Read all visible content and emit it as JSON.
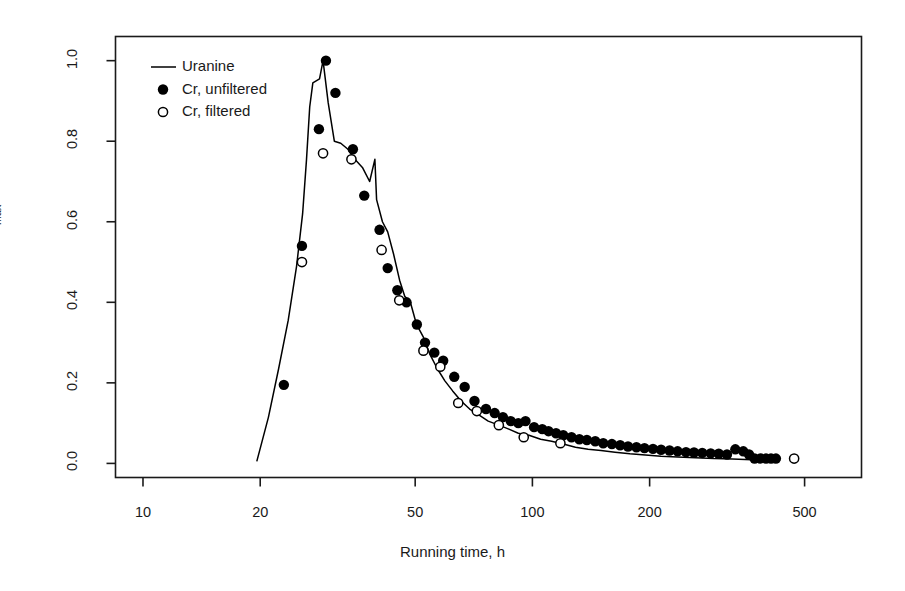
{
  "chart_data": {
    "type": "scatter",
    "title": "",
    "xlabel": "Running time, h",
    "ylabel": "C/Cmax",
    "ylabel_base": "C/C",
    "ylabel_sub": "max",
    "xscale": "log",
    "yscale": "linear",
    "xlim": [
      8.5,
      700
    ],
    "ylim": [
      -0.035,
      1.06
    ],
    "grid": false,
    "xticks": [
      10,
      20,
      50,
      100,
      200,
      500
    ],
    "xtick_labels": [
      "10",
      "20",
      "50",
      "100",
      "200",
      "500"
    ],
    "yticks": [
      0.0,
      0.2,
      0.4,
      0.6,
      0.8,
      1.0
    ],
    "ytick_labels": [
      "0.0",
      "0.2",
      "0.4",
      "0.6",
      "0.8",
      "1.0"
    ],
    "legend_position": "top-left",
    "series": [
      {
        "name": "Uranine",
        "marker": "line",
        "color": "#000000",
        "points": [
          [
            19.6,
            0.005
          ],
          [
            21.0,
            0.115
          ],
          [
            22.3,
            0.235
          ],
          [
            23.6,
            0.355
          ],
          [
            24.8,
            0.49
          ],
          [
            25.7,
            0.62
          ],
          [
            26.3,
            0.755
          ],
          [
            26.8,
            0.885
          ],
          [
            27.3,
            0.945
          ],
          [
            28.4,
            0.955
          ],
          [
            29.0,
            1.0
          ],
          [
            29.9,
            0.895
          ],
          [
            31.0,
            0.8
          ],
          [
            32.2,
            0.795
          ],
          [
            33.6,
            0.78
          ],
          [
            35.0,
            0.755
          ],
          [
            36.6,
            0.735
          ],
          [
            38.2,
            0.7
          ],
          [
            39.4,
            0.755
          ],
          [
            39.8,
            0.655
          ],
          [
            41.2,
            0.6
          ],
          [
            42.5,
            0.575
          ],
          [
            44.0,
            0.52
          ],
          [
            45.6,
            0.455
          ],
          [
            47.0,
            0.415
          ],
          [
            48.6,
            0.4
          ],
          [
            50.4,
            0.345
          ],
          [
            52.4,
            0.315
          ],
          [
            54.6,
            0.27
          ],
          [
            57.0,
            0.235
          ],
          [
            59.6,
            0.205
          ],
          [
            62.4,
            0.18
          ],
          [
            65.6,
            0.155
          ],
          [
            69.0,
            0.135
          ],
          [
            73.0,
            0.12
          ],
          [
            77.0,
            0.105
          ],
          [
            82.0,
            0.095
          ],
          [
            87.0,
            0.085
          ],
          [
            92.0,
            0.075
          ],
          [
            98.0,
            0.07
          ],
          [
            105.0,
            0.06
          ],
          [
            112.0,
            0.055
          ],
          [
            120.0,
            0.048
          ],
          [
            129.0,
            0.04
          ],
          [
            139.0,
            0.035
          ],
          [
            150.0,
            0.032
          ],
          [
            163.0,
            0.028
          ],
          [
            178.0,
            0.024
          ],
          [
            195.0,
            0.021
          ],
          [
            214.0,
            0.018
          ],
          [
            236.0,
            0.016
          ],
          [
            262.0,
            0.014
          ],
          [
            292.0,
            0.012
          ],
          [
            326.0,
            0.011
          ],
          [
            366.0,
            0.009
          ],
          [
            410.0,
            0.008
          ]
        ]
      },
      {
        "name": "Cr, unfiltered",
        "marker": "filled-circle",
        "color": "#000000",
        "points": [
          [
            23.0,
            0.195
          ],
          [
            25.6,
            0.54
          ],
          [
            28.3,
            0.83
          ],
          [
            29.5,
            1.0
          ],
          [
            31.2,
            0.92
          ],
          [
            34.6,
            0.78
          ],
          [
            37.0,
            0.665
          ],
          [
            40.5,
            0.58
          ],
          [
            42.5,
            0.485
          ],
          [
            45.0,
            0.43
          ],
          [
            47.5,
            0.4
          ],
          [
            50.5,
            0.345
          ],
          [
            53.0,
            0.3
          ],
          [
            56.0,
            0.275
          ],
          [
            59.0,
            0.255
          ],
          [
            63.0,
            0.215
          ],
          [
            67.0,
            0.19
          ],
          [
            71.0,
            0.155
          ],
          [
            76.0,
            0.135
          ],
          [
            80.0,
            0.125
          ],
          [
            84.0,
            0.115
          ],
          [
            88.0,
            0.105
          ],
          [
            92.0,
            0.1
          ],
          [
            96.0,
            0.105
          ],
          [
            101.0,
            0.09
          ],
          [
            106.0,
            0.085
          ],
          [
            110.0,
            0.08
          ],
          [
            115.0,
            0.075
          ],
          [
            120.0,
            0.07
          ],
          [
            126.0,
            0.065
          ],
          [
            132.0,
            0.06
          ],
          [
            138.0,
            0.058
          ],
          [
            145.0,
            0.055
          ],
          [
            152.0,
            0.05
          ],
          [
            160.0,
            0.048
          ],
          [
            168.0,
            0.045
          ],
          [
            176.0,
            0.042
          ],
          [
            185.0,
            0.04
          ],
          [
            194.0,
            0.038
          ],
          [
            204.0,
            0.036
          ],
          [
            214.0,
            0.034
          ],
          [
            225.0,
            0.032
          ],
          [
            236.0,
            0.03
          ],
          [
            248.0,
            0.028
          ],
          [
            260.0,
            0.027
          ],
          [
            273.0,
            0.026
          ],
          [
            287.0,
            0.025
          ],
          [
            301.0,
            0.024
          ],
          [
            316.0,
            0.022
          ],
          [
            332.0,
            0.035
          ],
          [
            348.0,
            0.03
          ],
          [
            360.0,
            0.022
          ],
          [
            372.0,
            0.012
          ],
          [
            385.0,
            0.012
          ],
          [
            398.0,
            0.012
          ],
          [
            410.0,
            0.012
          ],
          [
            422.0,
            0.012
          ]
        ]
      },
      {
        "name": "Cr, filtered",
        "marker": "open-circle",
        "color": "#000000",
        "points": [
          [
            25.6,
            0.5
          ],
          [
            29.0,
            0.77
          ],
          [
            34.3,
            0.755
          ],
          [
            41.0,
            0.53
          ],
          [
            45.5,
            0.405
          ],
          [
            52.5,
            0.28
          ],
          [
            58.0,
            0.24
          ],
          [
            64.5,
            0.15
          ],
          [
            72.0,
            0.13
          ],
          [
            82.0,
            0.095
          ],
          [
            95.0,
            0.065
          ],
          [
            118.0,
            0.05
          ],
          [
            470.0,
            0.012
          ]
        ]
      }
    ]
  },
  "legend": {
    "entries": [
      {
        "label": "Uranine",
        "marker": "line"
      },
      {
        "label": "Cr, unfiltered",
        "marker": "filled-circle"
      },
      {
        "label": "Cr, filtered",
        "marker": "open-circle"
      }
    ]
  },
  "axes": {
    "x_label": "Running time, h",
    "y_label_base": "C/C",
    "y_label_sub": "max",
    "x_tick_labels": [
      "10",
      "20",
      "50",
      "100",
      "200",
      "500"
    ],
    "y_tick_labels": [
      "0.0",
      "0.2",
      "0.4",
      "0.6",
      "0.8",
      "1.0"
    ]
  },
  "style": {
    "frame_color": "#1a1a1a",
    "data_color": "#000000",
    "background": "#ffffff"
  }
}
